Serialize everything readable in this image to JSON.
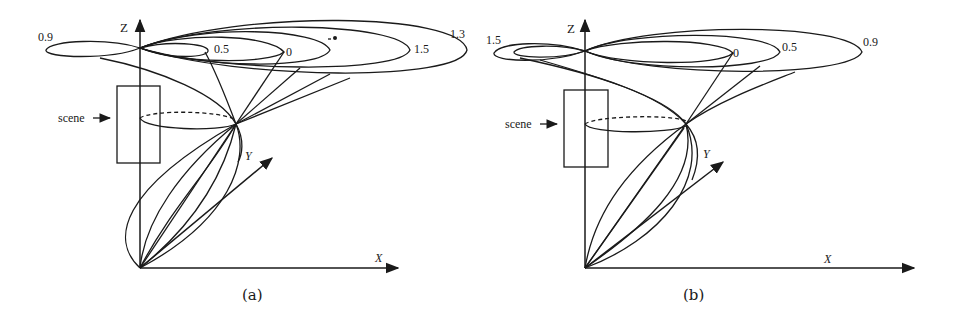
{
  "figure": {
    "panels": [
      {
        "id": "a",
        "caption": "(a)",
        "axes": {
          "z": "Z",
          "y": "Y",
          "x": "X"
        },
        "scene_label": "scene",
        "lobe_labels": [
          "0.9",
          "0.5",
          "0",
          "1.5",
          "1.3"
        ]
      },
      {
        "id": "b",
        "caption": "(b)",
        "axes": {
          "z": "Z",
          "y": "Y",
          "x": "X"
        },
        "scene_label": "scene",
        "lobe_labels": [
          "1.5",
          "0",
          "0.5",
          "0.9"
        ]
      }
    ],
    "colors": {
      "ink": "#1a1a1a",
      "background": "#ffffff"
    }
  }
}
